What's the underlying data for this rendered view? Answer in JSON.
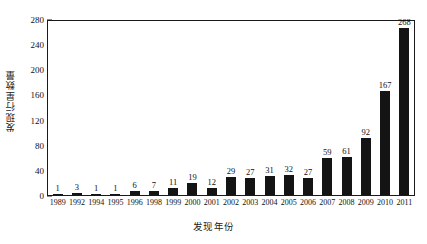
{
  "chart_data": {
    "type": "bar",
    "title": "",
    "xlabel": "发现年份",
    "ylabel": "发现行星数量",
    "categories": [
      "1989",
      "1992",
      "1994",
      "1995",
      "1996",
      "1998",
      "1999",
      "2000",
      "2001",
      "2002",
      "2003",
      "2004",
      "2005",
      "2006",
      "2007",
      "2008",
      "2009",
      "2010",
      "2011"
    ],
    "values": [
      1,
      3,
      1,
      1,
      6,
      7,
      11,
      19,
      12,
      29,
      27,
      31,
      32,
      27,
      59,
      61,
      92,
      167,
      268
    ],
    "series": [
      {
        "name": "发现行星数量",
        "values": [
          1,
          3,
          1,
          1,
          6,
          7,
          11,
          19,
          12,
          29,
          27,
          31,
          32,
          27,
          59,
          61,
          92,
          167,
          268
        ]
      }
    ],
    "value_labels": [
      "1",
      "3",
      "1",
      "1",
      "6",
      "7",
      "11",
      "19",
      "12",
      "29",
      "27",
      "31",
      "32",
      "27",
      "59",
      "61",
      "92",
      "167",
      "268"
    ],
    "ylim": [
      0,
      280
    ],
    "y_major_ticks": [
      0,
      40,
      80,
      120,
      160,
      200,
      240,
      280
    ],
    "y_major_tick_labels": [
      "0",
      "40",
      "80",
      "120",
      "160",
      "200",
      "240",
      "280"
    ],
    "y_minor_tick_interval": 20,
    "y_minor_ticks": [
      20,
      60,
      100,
      140,
      180,
      220,
      260
    ],
    "grid": false,
    "legend": false,
    "bar_color": "#141414",
    "axis_color": "#1a1a1a",
    "background_color": "#ffffff"
  }
}
